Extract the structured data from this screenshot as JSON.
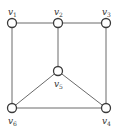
{
  "graph": {
    "nodes": [
      {
        "id": "v1",
        "label": "v",
        "sub": "1",
        "x": 12,
        "y": 23,
        "lx": 8,
        "ly": 15
      },
      {
        "id": "v2",
        "label": "v",
        "sub": "2",
        "x": 58,
        "y": 23,
        "lx": 54,
        "ly": 15
      },
      {
        "id": "v3",
        "label": "v",
        "sub": "3",
        "x": 106,
        "y": 23,
        "lx": 102,
        "ly": 15
      },
      {
        "id": "v5",
        "label": "v",
        "sub": "5",
        "x": 58,
        "y": 71,
        "lx": 54,
        "ly": 87
      },
      {
        "id": "v6",
        "label": "v",
        "sub": "6",
        "x": 12,
        "y": 108,
        "lx": 8,
        "ly": 124
      },
      {
        "id": "v4",
        "label": "v",
        "sub": "4",
        "x": 106,
        "y": 108,
        "lx": 102,
        "ly": 124
      }
    ],
    "edges": [
      [
        "v1",
        "v2"
      ],
      [
        "v2",
        "v3"
      ],
      [
        "v1",
        "v6"
      ],
      [
        "v3",
        "v4"
      ],
      [
        "v2",
        "v5"
      ],
      [
        "v5",
        "v6"
      ],
      [
        "v5",
        "v4"
      ],
      [
        "v6",
        "v4"
      ]
    ],
    "colors": {
      "edge": "#6a6a6a",
      "node_stroke": "#3a3a3a",
      "node_fill": "#ffffff"
    }
  }
}
